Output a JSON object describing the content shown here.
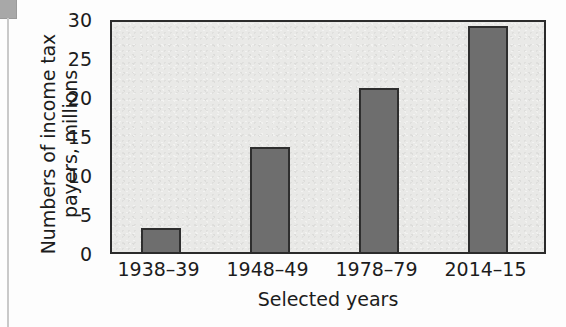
{
  "chart_data": {
    "type": "bar",
    "title": "",
    "xlabel": "Selected years",
    "ylabel": "Numbers of income tax payers, millions",
    "categories": [
      "1938–39",
      "1948–49",
      "1978–79",
      "2014–15"
    ],
    "values": [
      3.1,
      13.4,
      21.0,
      29.0
    ],
    "ylim": [
      0,
      30
    ],
    "yticks": [
      0,
      5,
      10,
      15,
      20,
      25,
      30
    ],
    "ytick_labels": [
      "0",
      "5",
      "10",
      "15",
      "20",
      "25",
      "30"
    ],
    "grid": false,
    "legend": false,
    "bar_color": "#6e6e6e",
    "bar_edge_color": "#2e2e2e",
    "plot_background": "#e9e9e7",
    "axis_color": "#2b2b2b"
  },
  "axes": {
    "y_title_lines": [
      "Numbers of income tax",
      "payers, millions"
    ],
    "x_title": "Selected years"
  }
}
